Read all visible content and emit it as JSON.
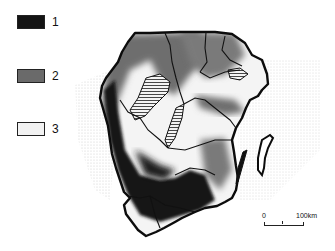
{
  "legend": {
    "items": [
      {
        "label": "1",
        "color": "#141414"
      },
      {
        "label": "2",
        "color": "#6a6a6a"
      },
      {
        "label": "3",
        "color": "#f2f2f2"
      }
    ]
  },
  "scale_bar": {
    "start_label": "0",
    "end_label": "100km"
  },
  "colors": {
    "class1": "#141414",
    "class2": "#6e6e6e",
    "class3": "#f4f4f4",
    "boundary": "#111111",
    "sea_stipple": "#c8c8c8"
  }
}
